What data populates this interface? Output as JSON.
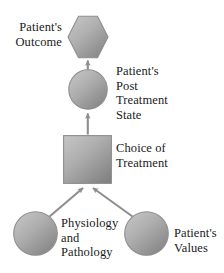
{
  "diagram": {
    "type": "influence-diagram",
    "background_color": "#ffffff",
    "text_color": "#1a1a1a",
    "node_fill_light": "#c2c2c2",
    "node_fill_dark": "#878787",
    "node_stroke": "#8a8a8a",
    "arrow_color": "#8e8e8e"
  },
  "nodes": {
    "outcome": {
      "label": "Patient's\nOutcome",
      "shape": "hexagon",
      "label_position": "left"
    },
    "post_treatment_state": {
      "label": "Patient's\nPost\nTreatment\nState",
      "shape": "circle",
      "label_position": "right"
    },
    "choice_of_treatment": {
      "label": "Choice of\nTreatment",
      "shape": "square",
      "label_position": "right"
    },
    "physiology_and_pathology": {
      "label": "Physiology\nand\nPathology",
      "shape": "circle",
      "label_position": "right"
    },
    "patients_values": {
      "label": "Patient's\nValues",
      "shape": "circle",
      "label_position": "right"
    }
  },
  "edges": [
    {
      "from": "post_treatment_state",
      "to": "outcome",
      "style": "arrow",
      "direction": "up"
    },
    {
      "from": "choice_of_treatment",
      "to": "post_treatment_state",
      "style": "arrow",
      "direction": "up"
    },
    {
      "from": "physiology_and_pathology",
      "to": "choice_of_treatment",
      "style": "arrow",
      "direction": "up-right"
    },
    {
      "from": "patients_values",
      "to": "choice_of_treatment",
      "style": "arrow",
      "direction": "up-left"
    }
  ]
}
